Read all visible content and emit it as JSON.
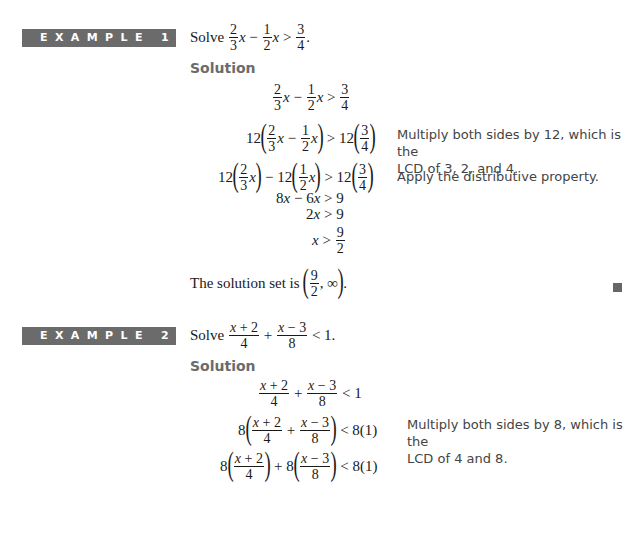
{
  "example1": {
    "banner": "EXAMPLE 1",
    "prompt_word": "Solve",
    "solution_label": "Solution",
    "problem": {
      "a_num": "2",
      "a_den": "3",
      "b_num": "1",
      "b_den": "2",
      "c_num": "3",
      "c_den": "4",
      "var": "x",
      "minus": "−",
      "rel": ">",
      "end": "."
    },
    "steps": [
      {
        "expr": "2/3 x − 1/2 x > 3/4",
        "note": ""
      },
      {
        "expr": "12(2/3 x − 1/2 x) > 12(3/4)",
        "note": "Multiply both sides by 12, which is the LCD of 3, 2, and 4."
      },
      {
        "expr": "12(2/3 x) − 12(1/2 x) > 12(3/4)",
        "note": "Apply the distributive property."
      },
      {
        "expr": "8x − 6x > 9",
        "note": ""
      },
      {
        "expr": "2x > 9",
        "note": ""
      },
      {
        "expr": "x > 9/2",
        "note": ""
      }
    ],
    "step_tokens": {
      "twelve": "12",
      "eight_x": "8",
      "six_x": "6",
      "nine": "9",
      "two": "2",
      "infinity": "∞",
      "comma": ","
    },
    "conclusion_text": "The solution set is",
    "conclusion_end": ".",
    "note1_line1": "Multiply both sides by 12, which is the",
    "note1_line2": "LCD of 3, 2, and 4.",
    "note2": "Apply the distributive property."
  },
  "example2": {
    "banner": "EXAMPLE 2",
    "prompt_word": "Solve",
    "solution_label": "Solution",
    "problem": {
      "n1": "x + 2",
      "d1": "4",
      "n2": "x − 3",
      "d2": "8",
      "plus": "+",
      "rel": "<",
      "rhs": "1",
      "end": "."
    },
    "steps": [
      {
        "expr": "(x+2)/4 + (x−3)/8 < 1",
        "note": ""
      },
      {
        "expr": "8((x+2)/4 + (x−3)/8) < 8(1)",
        "note": "Multiply both sides by 8, which is the LCD of 4 and 8."
      },
      {
        "expr": "8((x+2)/4) + 8((x−3)/8) < 8(1)",
        "note": ""
      }
    ],
    "tokens": {
      "eight": "8",
      "rhs8": "8(1)"
    },
    "note1_line1": "Multiply both sides by 8, which is the",
    "note1_line2": "LCD of 4 and 8."
  },
  "colors": {
    "banner_bg": "#6b6b6b",
    "banner_text": "#ffffff",
    "solution_label": "#6b6b6b",
    "qed_square": "#666666"
  }
}
